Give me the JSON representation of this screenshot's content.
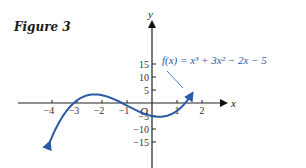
{
  "figure": {
    "title": "Figure 3"
  },
  "chart_data": {
    "type": "line",
    "title": "Figure 3",
    "xlabel": "x",
    "ylabel": "y",
    "function": "f(x) = x^3 + 3x^2 - 2x - 5",
    "annotation": "f(x) = x³ + 3x² − 2x − 5",
    "origin_label": "O",
    "x_ticks": [
      -4,
      -3,
      -2,
      -1,
      1,
      2
    ],
    "x_tick_labels": [
      "−4",
      "−3",
      "−2",
      "−1",
      "1",
      "2"
    ],
    "y_ticks": [
      15,
      10,
      5,
      -5,
      -10,
      -15
    ],
    "y_tick_labels": [
      "15",
      "10",
      "5",
      "−5",
      "−10",
      "−15"
    ],
    "xlim": [
      -4.2,
      2.8
    ],
    "ylim": [
      -17,
      17
    ],
    "x": [
      -4.0,
      -3.5,
      -3.0,
      -2.5,
      -2.0,
      -1.5,
      -1.0,
      -0.5,
      0.0,
      0.5,
      1.0,
      1.5
    ],
    "y": [
      -13.0,
      -2.125,
      1.0,
      1.875,
      3.0,
      1.375,
      -1.0,
      -3.375,
      -5.0,
      -5.125,
      -3.0,
      2.125
    ],
    "grid": false,
    "line_color": "#2a5aa6"
  }
}
